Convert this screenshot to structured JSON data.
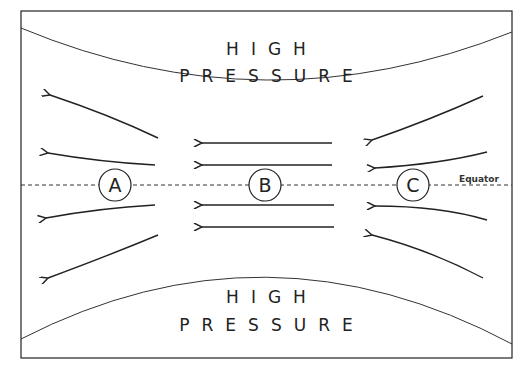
{
  "diagram": {
    "top_label": {
      "line1": "HIGH",
      "line2": "PRESSURE"
    },
    "bottom_label": {
      "line1": "HIGH",
      "line2": "PRESSURE"
    },
    "equator_label": "Equator",
    "points": [
      {
        "id": "A",
        "label": "A"
      },
      {
        "id": "B",
        "label": "B"
      },
      {
        "id": "C",
        "label": "C"
      }
    ],
    "colors": {
      "line": "#222222",
      "background": "#ffffff"
    }
  }
}
